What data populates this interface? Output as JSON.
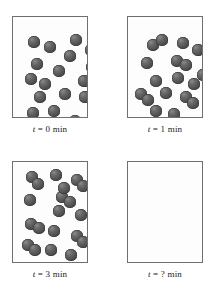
{
  "figure": {
    "type": "scientific-illustration",
    "colors": {
      "background": "#ffffff",
      "box_fill": "#fdfdfd",
      "box_border": "#6f6f6f",
      "sphere": "#525252",
      "text": "#1a1a1a"
    }
  },
  "panels": [
    {
      "id": "panel-0-min",
      "caption": {
        "variable": "t",
        "equals": "=",
        "value": "0",
        "unit": "min",
        "full": "t = 0 min"
      },
      "box": {
        "x": 12,
        "y": 16,
        "width": 76,
        "height": 102
      },
      "sphere_count": 18,
      "sphere_radius": 5.6,
      "spheres": [
        {
          "cx": 21,
          "cy": 25
        },
        {
          "cx": 37,
          "cy": 30
        },
        {
          "cx": 63,
          "cy": 23
        },
        {
          "cx": 57,
          "cy": 39
        },
        {
          "cx": 78,
          "cy": 33
        },
        {
          "cx": 24,
          "cy": 47
        },
        {
          "cx": 46,
          "cy": 54
        },
        {
          "cx": 79,
          "cy": 50
        },
        {
          "cx": 18,
          "cy": 62
        },
        {
          "cx": 32,
          "cy": 67
        },
        {
          "cx": 71,
          "cy": 64
        },
        {
          "cx": 27,
          "cy": 80
        },
        {
          "cx": 52,
          "cy": 77
        },
        {
          "cx": 72,
          "cy": 80
        },
        {
          "cx": 20,
          "cy": 96
        },
        {
          "cx": 41,
          "cy": 94
        },
        {
          "cx": 80,
          "cy": 93
        },
        {
          "cx": 62,
          "cy": 104
        }
      ],
      "caption_y": 124
    },
    {
      "id": "panel-1-min",
      "caption": {
        "variable": "t",
        "equals": "=",
        "value": "1",
        "unit": "min",
        "full": "t = 1 min"
      },
      "box": {
        "x": 127,
        "y": 16,
        "width": 76,
        "height": 102
      },
      "sphere_count": 18,
      "sphere_radius": 5.6,
      "spheres": [
        {
          "cx": 25,
          "cy": 28
        },
        {
          "cx": 34,
          "cy": 23
        },
        {
          "cx": 55,
          "cy": 26
        },
        {
          "cx": 70,
          "cy": 33
        },
        {
          "cx": 19,
          "cy": 46
        },
        {
          "cx": 49,
          "cy": 44
        },
        {
          "cx": 58,
          "cy": 48
        },
        {
          "cx": 28,
          "cy": 64
        },
        {
          "cx": 50,
          "cy": 61
        },
        {
          "cx": 66,
          "cy": 67
        },
        {
          "cx": 13,
          "cy": 77
        },
        {
          "cx": 20,
          "cy": 83
        },
        {
          "cx": 38,
          "cy": 76
        },
        {
          "cx": 58,
          "cy": 80
        },
        {
          "cx": 65,
          "cy": 86
        },
        {
          "cx": 28,
          "cy": 94
        },
        {
          "cx": 46,
          "cy": 97
        },
        {
          "cx": 75,
          "cy": 58
        }
      ],
      "caption_y": 124
    },
    {
      "id": "panel-3-min",
      "caption": {
        "variable": "t",
        "equals": "=",
        "value": "3",
        "unit": "min",
        "full": "t = 3 min"
      },
      "box": {
        "x": 12,
        "y": 161,
        "width": 76,
        "height": 102
      },
      "sphere_count": 20,
      "sphere_radius": 5.6,
      "spheres": [
        {
          "cx": 19,
          "cy": 15
        },
        {
          "cx": 25,
          "cy": 22
        },
        {
          "cx": 43,
          "cy": 13
        },
        {
          "cx": 64,
          "cy": 18
        },
        {
          "cx": 70,
          "cy": 24
        },
        {
          "cx": 17,
          "cy": 38
        },
        {
          "cx": 49,
          "cy": 35
        },
        {
          "cx": 57,
          "cy": 40
        },
        {
          "cx": 46,
          "cy": 49
        },
        {
          "cx": 68,
          "cy": 53
        },
        {
          "cx": 18,
          "cy": 62
        },
        {
          "cx": 26,
          "cy": 66
        },
        {
          "cx": 41,
          "cy": 69
        },
        {
          "cx": 64,
          "cy": 74
        },
        {
          "cx": 70,
          "cy": 80
        },
        {
          "cx": 15,
          "cy": 83
        },
        {
          "cx": 22,
          "cy": 88
        },
        {
          "cx": 38,
          "cy": 88
        },
        {
          "cx": 58,
          "cy": 93
        },
        {
          "cx": 51,
          "cy": 26
        }
      ],
      "caption_y": 269
    },
    {
      "id": "panel-unknown-min",
      "caption": {
        "variable": "t",
        "equals": "=",
        "value": "?",
        "unit": "min",
        "full": "t = ? min"
      },
      "box": {
        "x": 127,
        "y": 161,
        "width": 76,
        "height": 102
      },
      "sphere_count": 0,
      "sphere_radius": 5.6,
      "spheres": [],
      "caption_y": 269
    }
  ]
}
